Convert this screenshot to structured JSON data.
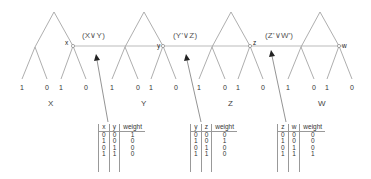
{
  "trees": [
    {
      "name": "X",
      "node_label": "x",
      "leaves": [
        "1",
        "0",
        "1",
        "0"
      ]
    },
    {
      "name": "Y",
      "node_label": "y",
      "leaves": [
        "1",
        "0",
        "1",
        "0"
      ]
    },
    {
      "name": "Z",
      "node_label": "z",
      "leaves": [
        "1",
        "0",
        "1",
        "0"
      ]
    },
    {
      "name": "W",
      "node_label": "w",
      "leaves": [
        "1",
        "0",
        "1",
        "0"
      ]
    }
  ],
  "clauses": [
    {
      "label": "(X∨Y)"
    },
    {
      "label": "(Y'∨Z)"
    },
    {
      "label": "(Z'∨W')"
    }
  ],
  "tables": [
    {
      "headers": [
        "x",
        "y",
        "weight"
      ],
      "rows": [
        [
          "0",
          "0",
          "1"
        ],
        [
          "1",
          "0",
          "0"
        ],
        [
          "0",
          "1",
          "0"
        ],
        [
          "1",
          "1",
          "0"
        ]
      ]
    },
    {
      "headers": [
        "y",
        "z",
        "weight"
      ],
      "rows": [
        [
          "0",
          "0",
          "0"
        ],
        [
          "1",
          "0",
          "1"
        ],
        [
          "0",
          "1",
          "0"
        ],
        [
          "1",
          "1",
          "0"
        ]
      ]
    },
    {
      "headers": [
        "z",
        "w",
        "weight"
      ],
      "rows": [
        [
          "0",
          "0",
          "0"
        ],
        [
          "1",
          "0",
          "0"
        ],
        [
          "0",
          "1",
          "0"
        ],
        [
          "1",
          "1",
          "1"
        ]
      ]
    }
  ],
  "colors": {
    "line": "#9a9a9a",
    "text": "#333333",
    "arrow": "#222222"
  }
}
